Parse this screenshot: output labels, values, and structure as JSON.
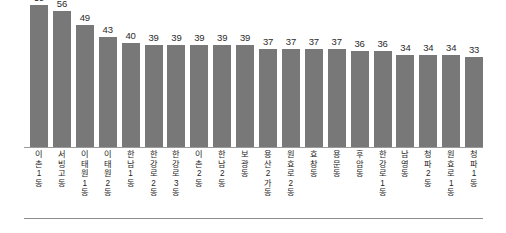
{
  "chart_data": {
    "type": "bar",
    "title": "",
    "subtitle": "",
    "xlabel": "",
    "ylabel": "",
    "ylim": [
      0,
      62
    ],
    "grid": false,
    "legend": null,
    "bar_color": "#787878",
    "axis_color": "#9a9a9a",
    "value_label_color": "#2b2b2b",
    "categories": [
      "이촌1동",
      "서빙고동",
      "이태원1동",
      "이태원2동",
      "한남1동",
      "한강로2동",
      "한강로3동",
      "이촌2동",
      "한남2동",
      "보광동",
      "용산2가동",
      "원효로2동",
      "효창동",
      "용문동",
      "후암동",
      "한강로1동",
      "남영동",
      "청파2동",
      "원효로1동",
      "청파1동"
    ],
    "category_lines": [
      [
        "이",
        "촌",
        "1",
        "동"
      ],
      [
        "서",
        "빙",
        "고",
        "동"
      ],
      [
        "이",
        "태",
        "원",
        "1",
        "동"
      ],
      [
        "이",
        "태",
        "원",
        "2",
        "동"
      ],
      [
        "한",
        "남",
        "1",
        "동"
      ],
      [
        "한",
        "강",
        "로",
        "2",
        "동"
      ],
      [
        "한",
        "강",
        "로",
        "3",
        "동"
      ],
      [
        "이",
        "촌",
        "2",
        "동"
      ],
      [
        "한",
        "남",
        "2",
        "동"
      ],
      [
        "보",
        "광",
        "동"
      ],
      [
        "용",
        "산",
        "2",
        "가",
        "동"
      ],
      [
        "원",
        "효",
        "로",
        "2",
        "동"
      ],
      [
        "효",
        "창",
        "동"
      ],
      [
        "용",
        "문",
        "동"
      ],
      [
        "후",
        "암",
        "동"
      ],
      [
        "한",
        "강",
        "로",
        "1",
        "동"
      ],
      [
        "남",
        "영",
        "동"
      ],
      [
        "청",
        "파",
        "2",
        "동"
      ],
      [
        "원",
        "효",
        "로",
        "1",
        "동"
      ],
      [
        "청",
        "파",
        "1",
        "동"
      ]
    ],
    "values": [
      59,
      56,
      49,
      43,
      40,
      39,
      39,
      39,
      39,
      39,
      37,
      37,
      37,
      37,
      36,
      36,
      34,
      34,
      34,
      33
    ]
  }
}
